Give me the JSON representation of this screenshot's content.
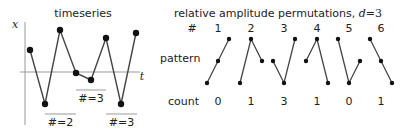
{
  "timeseries": {
    "title": "timeseries",
    "x_axis_label": "x",
    "t_axis_label": "t",
    "points": [
      [
        30,
        50
      ],
      [
        45,
        104
      ],
      [
        60,
        30
      ],
      [
        76,
        73
      ],
      [
        91,
        80
      ],
      [
        106,
        38
      ],
      [
        121,
        104
      ],
      [
        136,
        33
      ]
    ],
    "annotations": [
      {
        "label": "#=2",
        "x1": 45,
        "x2": 76,
        "y": 114,
        "label_y": 126
      },
      {
        "label": "#=3",
        "x1": 76,
        "x2": 106,
        "y": 90,
        "label_y": 102
      },
      {
        "label": "#=3",
        "x1": 106,
        "x2": 137,
        "y": 114,
        "label_y": 126
      }
    ]
  },
  "permutations": {
    "title_prefix": "relative amplitude permutations, ",
    "title_var": "d",
    "title_eq": "=3",
    "row_labels": {
      "index": "#",
      "pattern": "pattern",
      "count": "count"
    },
    "columns": [
      {
        "index": "1",
        "count": "0",
        "pattern": [
          [
            207,
            83
          ],
          [
            218,
            61
          ],
          [
            229,
            39
          ]
        ]
      },
      {
        "index": "2",
        "count": "1",
        "pattern": [
          [
            240,
            83
          ],
          [
            251,
            39
          ],
          [
            262,
            61
          ]
        ]
      },
      {
        "index": "3",
        "count": "3",
        "pattern": [
          [
            273,
            61
          ],
          [
            284,
            83
          ],
          [
            295,
            39
          ]
        ]
      },
      {
        "index": "4",
        "count": "1",
        "pattern": [
          [
            306,
            61
          ],
          [
            317,
            39
          ],
          [
            328,
            83
          ]
        ]
      },
      {
        "index": "5",
        "count": "0",
        "pattern": [
          [
            338,
            39
          ],
          [
            349,
            83
          ],
          [
            360,
            61
          ]
        ]
      },
      {
        "index": "6",
        "count": "1",
        "pattern": [
          [
            370,
            39
          ],
          [
            381,
            61
          ],
          [
            392,
            83
          ]
        ]
      }
    ]
  },
  "colors": {
    "line": "#444444",
    "axis": "#999999",
    "dot": "#111111",
    "text": "#222222"
  }
}
